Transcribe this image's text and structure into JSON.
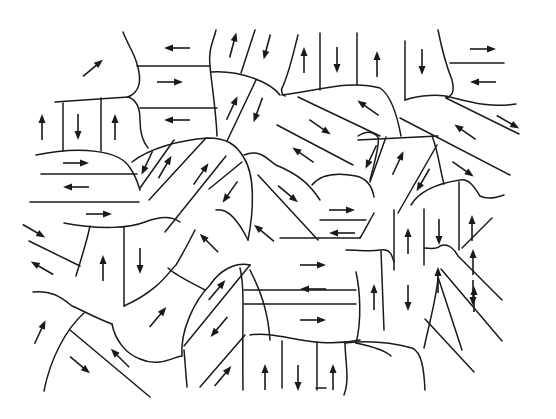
{
  "figure": {
    "colors": {
      "line": "#1a1a1a",
      "background": "#ffffff"
    },
    "arrow_style": {
      "length": 26,
      "head_length": 9,
      "head_width": 7
    },
    "arrows": [
      {
        "x": 93,
        "y": 68,
        "angle": -40
      },
      {
        "x": 177,
        "y": 48,
        "angle": 180
      },
      {
        "x": 170,
        "y": 82,
        "angle": 0
      },
      {
        "x": 177,
        "y": 120,
        "angle": 180
      },
      {
        "x": 42,
        "y": 127,
        "angle": -90
      },
      {
        "x": 78,
        "y": 127,
        "angle": 90
      },
      {
        "x": 115,
        "y": 127,
        "angle": -90
      },
      {
        "x": 76,
        "y": 163,
        "angle": 0
      },
      {
        "x": 76,
        "y": 187,
        "angle": 180
      },
      {
        "x": 233,
        "y": 45,
        "angle": -75
      },
      {
        "x": 267,
        "y": 47,
        "angle": 105
      },
      {
        "x": 232,
        "y": 108,
        "angle": -65
      },
      {
        "x": 258,
        "y": 110,
        "angle": 110
      },
      {
        "x": 147,
        "y": 163,
        "angle": 115
      },
      {
        "x": 165,
        "y": 167,
        "angle": -60
      },
      {
        "x": 201,
        "y": 174,
        "angle": -55
      },
      {
        "x": 230,
        "y": 192,
        "angle": 125
      },
      {
        "x": 209,
        "y": 243,
        "angle": -135
      },
      {
        "x": 288,
        "y": 194,
        "angle": 40
      },
      {
        "x": 264,
        "y": 233,
        "angle": -140
      },
      {
        "x": 304,
        "y": 60,
        "angle": -90
      },
      {
        "x": 337,
        "y": 60,
        "angle": 90
      },
      {
        "x": 377,
        "y": 64,
        "angle": -90
      },
      {
        "x": 422,
        "y": 62,
        "angle": 90
      },
      {
        "x": 483,
        "y": 49,
        "angle": 0
      },
      {
        "x": 483,
        "y": 82,
        "angle": 180
      },
      {
        "x": 368,
        "y": 108,
        "angle": -145
      },
      {
        "x": 320,
        "y": 127,
        "angle": 35
      },
      {
        "x": 303,
        "y": 155,
        "angle": -145
      },
      {
        "x": 371,
        "y": 157,
        "angle": 115
      },
      {
        "x": 398,
        "y": 163,
        "angle": -65
      },
      {
        "x": 423,
        "y": 180,
        "angle": 120
      },
      {
        "x": 465,
        "y": 132,
        "angle": -145
      },
      {
        "x": 508,
        "y": 122,
        "angle": 30
      },
      {
        "x": 463,
        "y": 169,
        "angle": 35
      },
      {
        "x": 34,
        "y": 231,
        "angle": 30
      },
      {
        "x": 42,
        "y": 268,
        "angle": -150
      },
      {
        "x": 103,
        "y": 268,
        "angle": -90
      },
      {
        "x": 140,
        "y": 261,
        "angle": 90
      },
      {
        "x": 99,
        "y": 214,
        "angle": 0
      },
      {
        "x": 40,
        "y": 332,
        "angle": -65
      },
      {
        "x": 80,
        "y": 365,
        "angle": 40
      },
      {
        "x": 120,
        "y": 358,
        "angle": -135
      },
      {
        "x": 158,
        "y": 317,
        "angle": -50
      },
      {
        "x": 217,
        "y": 290,
        "angle": -50
      },
      {
        "x": 219,
        "y": 327,
        "angle": 130
      },
      {
        "x": 223,
        "y": 376,
        "angle": -50
      },
      {
        "x": 265,
        "y": 377,
        "angle": -90
      },
      {
        "x": 298,
        "y": 378,
        "angle": 90
      },
      {
        "x": 333,
        "y": 377,
        "angle": -90
      },
      {
        "x": 342,
        "y": 210,
        "angle": 0
      },
      {
        "x": 342,
        "y": 233,
        "angle": 180
      },
      {
        "x": 313,
        "y": 265,
        "angle": 0
      },
      {
        "x": 313,
        "y": 289,
        "angle": 180
      },
      {
        "x": 313,
        "y": 320,
        "angle": 0
      },
      {
        "x": 408,
        "y": 241,
        "angle": -90
      },
      {
        "x": 439,
        "y": 232,
        "angle": 90
      },
      {
        "x": 472,
        "y": 228,
        "angle": -90
      },
      {
        "x": 374,
        "y": 297,
        "angle": -90
      },
      {
        "x": 408,
        "y": 298,
        "angle": 90
      },
      {
        "x": 438,
        "y": 280,
        "angle": -90
      },
      {
        "x": 473,
        "y": 293,
        "angle": 90
      },
      {
        "x": 473,
        "y": 262,
        "angle": -90
      },
      {
        "x": 474,
        "y": 299,
        "angle": -90
      },
      {
        "x": 474,
        "y": 293,
        "angle": 90
      },
      {
        "x": 474,
        "y": 296,
        "angle": -90
      },
      {
        "x": 474,
        "y": 295,
        "angle": 90
      },
      {
        "x": 475,
        "y": 294,
        "angle": -90
      },
      {
        "x": 475,
        "y": 296,
        "angle": 90
      },
      {
        "x": 475,
        "y": 295,
        "angle": -90
      },
      {
        "x": 475,
        "y": 294,
        "angle": 90
      },
      {
        "x": 475,
        "y": 296,
        "angle": -90
      },
      {
        "x": 475,
        "y": 295,
        "angle": 90
      },
      {
        "x": 475,
        "y": 294,
        "angle": -90
      },
      {
        "x": 475,
        "y": 296,
        "angle": 90
      },
      {
        "x": 475,
        "y": 295,
        "angle": -90
      },
      {
        "x": 475,
        "y": 294,
        "angle": 90
      },
      {
        "x": 475,
        "y": 296,
        "angle": -90
      },
      {
        "x": 475,
        "y": 295,
        "angle": 90
      },
      {
        "x": 475,
        "y": 294,
        "angle": -90
      },
      {
        "x": 475,
        "y": 296,
        "angle": 90
      },
      {
        "x": 475,
        "y": 295,
        "angle": -90
      },
      {
        "x": 475,
        "y": 294,
        "angle": 90
      },
      {
        "x": 475,
        "y": 296,
        "angle": -90
      },
      {
        "x": 475,
        "y": 295,
        "angle": 90
      },
      {
        "x": 475,
        "y": 294,
        "angle": -90
      },
      {
        "x": 475,
        "y": 296,
        "angle": 90
      },
      {
        "x": 475,
        "y": 295,
        "angle": -90
      },
      {
        "x": 475,
        "y": 294,
        "angle": 90
      },
      {
        "x": 475,
        "y": 296,
        "angle": -90
      },
      {
        "x": 475,
        "y": 295,
        "angle": 90
      },
      {
        "x": 475,
        "y": 294,
        "angle": -90
      },
      {
        "x": 475,
        "y": 296,
        "angle": 90
      },
      {
        "x": 475,
        "y": 295,
        "angle": -90
      },
      {
        "x": 475,
        "y": 294,
        "angle": 90
      },
      {
        "x": 475,
        "y": 296,
        "angle": -90
      },
      {
        "x": 475,
        "y": 295,
        "angle": 90
      }
    ]
  }
}
